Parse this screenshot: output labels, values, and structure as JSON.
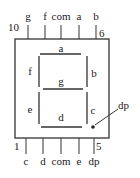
{
  "diagram": {
    "title": "",
    "type": "seven-segment-display-pinout",
    "top_pins": {
      "labels": [
        "g",
        "f",
        "com",
        "a",
        "b"
      ],
      "first_pin_number": "10",
      "last_pin_number": "6"
    },
    "bottom_pins": {
      "labels": [
        "c",
        "d",
        "com",
        "e",
        "dp"
      ],
      "first_pin_number": "1",
      "last_pin_number": "5"
    },
    "segments": {
      "a": "a",
      "b": "b",
      "c": "c",
      "d": "d",
      "e": "e",
      "f": "f",
      "g": "g"
    },
    "decimal_point_label": "dp",
    "colors": {
      "line": "#333333",
      "background": "#ffffff"
    }
  }
}
